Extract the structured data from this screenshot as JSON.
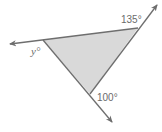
{
  "diagram": {
    "type": "triangle-exterior-angles",
    "fill_color": "#d9d9d9",
    "line_color": "#6e6e6e",
    "label_color": "#6b6b6b",
    "labels": {
      "top_right": "135°",
      "bottom": "100°",
      "left": "y°"
    },
    "vertices": {
      "left": [
        43,
        40
      ],
      "right": [
        138,
        28
      ],
      "bottom": [
        90,
        94
      ]
    }
  }
}
